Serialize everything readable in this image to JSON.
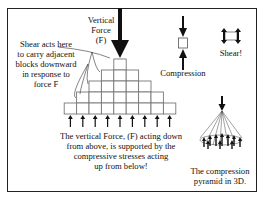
{
  "labels": {
    "vertical_force_line1": "Vertical",
    "vertical_force_line2": "Force",
    "vertical_force_line3": "(F)",
    "shear_note": [
      "Shear acts here",
      "to carry adjacent",
      "blocks downward",
      "in response to",
      "force F"
    ],
    "compression": "Compression",
    "shear": "Shear!",
    "main_caption": [
      "The vertical Force, (F) acting down",
      "from above, is supported by the",
      "compressive stresses acting",
      "up from below!"
    ],
    "pyramid_3d_caption": [
      "The compression",
      "pyramid in 3D."
    ]
  },
  "pyramid": {
    "rows": [
      1,
      3,
      5,
      7,
      9
    ],
    "block_size_px": 12.4,
    "support_arrow_count": 9
  },
  "colors": {
    "stroke": "#222222",
    "block_fill": "#ffffff",
    "block_stroke": "#777777",
    "background": "#ffffff"
  }
}
